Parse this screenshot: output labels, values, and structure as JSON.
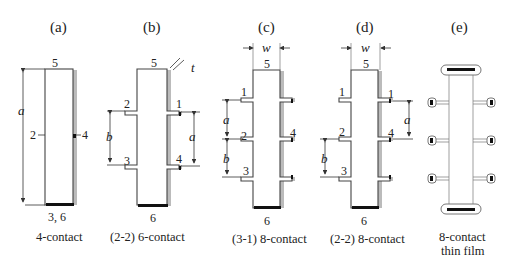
{
  "panels": [
    {
      "id": "a",
      "label": "(a)",
      "caption": "4-contact",
      "bottom": "3, 6",
      "top": "5",
      "contacts": [
        "2",
        "4"
      ],
      "dims": [
        "a"
      ]
    },
    {
      "id": "b",
      "label": "(b)",
      "caption": "(2-2) 6-contact",
      "bottom": "6",
      "top": "5",
      "contacts": [
        "1",
        "2",
        "3",
        "4"
      ],
      "dims": [
        "a",
        "b",
        "t"
      ]
    },
    {
      "id": "c",
      "label": "(c)",
      "caption": "(3-1) 8-contact",
      "bottom": "6",
      "top": "5",
      "contacts": [
        "1",
        "2",
        "3",
        "4"
      ],
      "dims": [
        "w",
        "a",
        "b"
      ]
    },
    {
      "id": "d",
      "label": "(d)",
      "caption": "(2-2) 8-contact",
      "bottom": "6",
      "top": "5",
      "contacts": [
        "1",
        "2",
        "3",
        "4"
      ],
      "dims": [
        "w",
        "a",
        "b"
      ]
    },
    {
      "id": "e",
      "label": "(e)",
      "caption_line1": "8-contact",
      "caption_line2": "thin film"
    }
  ],
  "symbols": {
    "a": "a",
    "b": "b",
    "t": "t",
    "w": "w"
  }
}
